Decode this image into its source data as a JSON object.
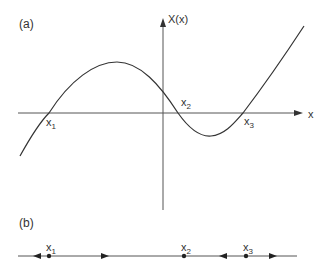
{
  "panel_a": {
    "label": "(a)",
    "y_axis_label": "X(x)",
    "x_axis_label": "x",
    "roots": [
      {
        "name": "x",
        "sub": "1",
        "px": 49
      },
      {
        "name": "x",
        "sub": "2",
        "px": 178
      },
      {
        "name": "x",
        "sub": "3",
        "px": 243
      }
    ]
  },
  "panel_b": {
    "label": "(b)",
    "fixed_points": [
      {
        "name": "x",
        "sub": "1",
        "px": 49
      },
      {
        "name": "x",
        "sub": "2",
        "px": 184
      },
      {
        "name": "x",
        "sub": "3",
        "px": 246
      }
    ],
    "flow_arrows": [
      {
        "px": 37,
        "direction": "left"
      },
      {
        "px": 105,
        "direction": "right"
      },
      {
        "px": 223,
        "direction": "left"
      },
      {
        "px": 273,
        "direction": "right"
      }
    ]
  },
  "colors": {
    "line": "#333333",
    "axis": "#555555"
  }
}
